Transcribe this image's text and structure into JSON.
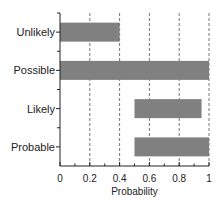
{
  "chart_data": {
    "type": "bar",
    "orientation": "horizontal",
    "title": "",
    "xlabel": "Probability",
    "ylabel": "",
    "categories": [
      "Unlikely",
      "Possible",
      "Likely",
      "Probable"
    ],
    "series": [
      {
        "name": "range",
        "start": [
          0,
          0,
          0.5,
          0.5
        ],
        "end": [
          0.4,
          1.0,
          0.95,
          1.0
        ]
      }
    ],
    "xlim": [
      0,
      1
    ],
    "xticks": [
      "0",
      "0.2",
      "0.4",
      "0.6",
      "0.8",
      "1"
    ],
    "grid": "vertical dashed at 0.2, 0.4, 0.6, 0.8, 1",
    "bar_color": "#808080"
  }
}
